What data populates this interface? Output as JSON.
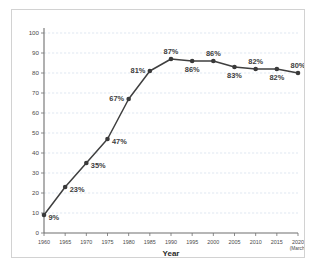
{
  "chart_data": {
    "type": "line",
    "title": "",
    "xlabel": "Year",
    "ylabel": "",
    "categories": [
      "1960",
      "1965",
      "1970",
      "1975",
      "1980",
      "1985",
      "1990",
      "1995",
      "2000",
      "2005",
      "2010",
      "2015",
      "2020"
    ],
    "x_tick_sublabels": [
      "",
      "",
      "",
      "",
      "",
      "",
      "",
      "",
      "",
      "",
      "",
      "",
      "(March)"
    ],
    "values": [
      9,
      23,
      35,
      47,
      67,
      81,
      87,
      86,
      86,
      83,
      82,
      82,
      80
    ],
    "point_labels": [
      "9%",
      "23%",
      "35%",
      "47%",
      "67%",
      "81%",
      "87%",
      "86%",
      "86%",
      "83%",
      "82%",
      "82%",
      "80%"
    ],
    "label_positions": [
      "right",
      "right",
      "right",
      "right",
      "left",
      "left",
      "above",
      "below",
      "above",
      "below",
      "above",
      "below",
      "above"
    ],
    "ylim": [
      0,
      100
    ],
    "y_ticks": [
      0,
      10,
      20,
      30,
      40,
      50,
      60,
      70,
      80,
      90,
      100
    ],
    "y_tick_labels": [
      "0",
      "10",
      "20",
      "30",
      "40",
      "50",
      "60",
      "70",
      "80",
      "90",
      "100"
    ],
    "grid": true,
    "grid_axis": "y",
    "legend": "none",
    "marker": "circle",
    "colors": {
      "line": "#3f3f3f",
      "marker": "#3a3a3a",
      "grid": "#c9d6e8",
      "axis": "#6f6f6f",
      "label_text": "#3d3d3d",
      "border": "#d2d2d2",
      "background": "#ffffff"
    }
  }
}
